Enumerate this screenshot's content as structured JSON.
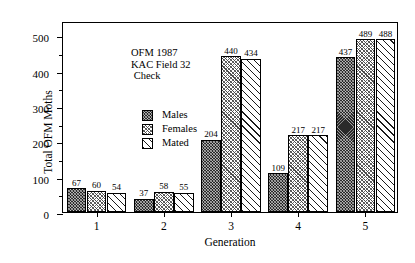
{
  "chart_data": {
    "type": "bar",
    "title": "",
    "annotation_lines": [
      "OFM 1987",
      "KAC Field 32",
      " Check"
    ],
    "xlabel": "Generation",
    "ylabel": "Total OFM Moths",
    "categories": [
      "1",
      "2",
      "3",
      "4",
      "5"
    ],
    "ylim": [
      0,
      540
    ],
    "ytick_labels": [
      "0",
      "100",
      "200",
      "300",
      "400",
      "500"
    ],
    "ytick_values": [
      0,
      100,
      200,
      300,
      400,
      500
    ],
    "yminor_values": [
      50,
      150,
      250,
      350,
      450
    ],
    "grid": false,
    "legend_position": "upper-left-inside",
    "series": [
      {
        "name": "Males",
        "pattern": "dense-dark-crosshatch",
        "values": [
          67,
          37,
          204,
          109,
          437
        ]
      },
      {
        "name": "Females",
        "pattern": "light-crosshatch",
        "values": [
          60,
          58,
          440,
          217,
          489
        ]
      },
      {
        "name": "Mated",
        "pattern": "sparse-diagonal",
        "values": [
          54,
          55,
          434,
          217,
          488
        ]
      }
    ]
  },
  "colors": {
    "axis": "#000000",
    "background": "#ffffff",
    "males_fill": "#2a2a2a",
    "females_fill": "#ffffff",
    "mated_fill": "#ffffff"
  }
}
